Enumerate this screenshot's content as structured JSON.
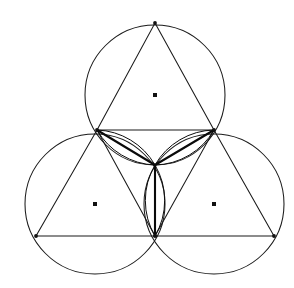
{
  "figure": {
    "canvas": {
      "width": 294,
      "height": 288,
      "background": "#ffffff"
    },
    "stroke_color": "#1a1a1a",
    "accent_stroke_color": "#0a0a0a",
    "dot_color": "#111111",
    "circle_radius": 70,
    "circles": [
      {
        "name": "top-circle",
        "cx": 155,
        "cy": 95,
        "r": 70
      },
      {
        "name": "left-circle",
        "cx": 95,
        "cy": 204,
        "r": 70
      },
      {
        "name": "right-circle",
        "cx": 214,
        "cy": 204,
        "r": 70
      }
    ],
    "center_dots": [
      {
        "name": "top-center-dot",
        "cx": 155,
        "cy": 95,
        "r": 2
      },
      {
        "name": "left-center-dot",
        "cx": 95,
        "cy": 204,
        "r": 2
      },
      {
        "name": "right-center-dot",
        "cx": 214,
        "cy": 204,
        "r": 2
      }
    ],
    "triangles": [
      {
        "name": "top-triangle",
        "points": "155,23 214,130 97,130"
      },
      {
        "name": "left-triangle",
        "points": "97,130 155,236 36,236"
      },
      {
        "name": "right-triangle",
        "points": "214,130 274,236 155,236"
      }
    ],
    "vertex_dots": [
      {
        "name": "apex-vertex-dot",
        "cx": 155,
        "cy": 23,
        "r": 1.9
      },
      {
        "name": "upper-left-vertex-dot",
        "cx": 97,
        "cy": 130,
        "r": 1.9
      },
      {
        "name": "upper-right-vertex-dot",
        "cx": 214,
        "cy": 130,
        "r": 1.9
      },
      {
        "name": "bottom-left-vertex-dot",
        "cx": 36,
        "cy": 236,
        "r": 1.9
      },
      {
        "name": "bottom-center-vertex-dot",
        "cx": 155,
        "cy": 236,
        "r": 2.1
      },
      {
        "name": "bottom-right-vertex-dot",
        "cx": 274,
        "cy": 236,
        "r": 1.9
      }
    ],
    "rosette": {
      "name": "central-three-petal-rosette",
      "hub": {
        "x": 155,
        "y": 165
      },
      "petals": [
        {
          "name": "petal-upper-left",
          "from": {
            "x": 97,
            "y": 130
          },
          "to": {
            "x": 155,
            "y": 165
          },
          "arc_outer": "M 97,130 A 70,70 0 0 1 155,165",
          "arc_inner": "M 97,130 A 70,70 0 0 0 155,165",
          "chord": "M 97,130 L 155,165"
        },
        {
          "name": "petal-upper-right",
          "from": {
            "x": 214,
            "y": 130
          },
          "to": {
            "x": 155,
            "y": 165
          },
          "arc_outer": "M 214,130 A 70,70 0 0 0 155,165",
          "arc_inner": "M 214,130 A 70,70 0 0 1 155,165",
          "chord": "M 214,130 L 155,165"
        },
        {
          "name": "petal-lower",
          "from": {
            "x": 155,
            "y": 236
          },
          "to": {
            "x": 155,
            "y": 165
          },
          "arc_outer": "M 155,236 A 70,70 0 0 1 155,165",
          "arc_inner": "M 155,236 A 70,70 0 0 0 155,165",
          "chord": "M 155,236 L 155,165"
        }
      ]
    }
  }
}
